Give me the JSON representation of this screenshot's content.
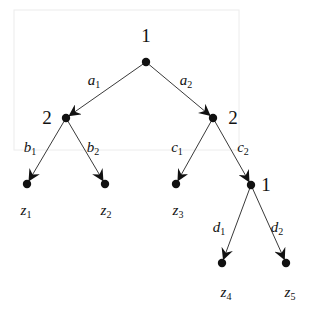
{
  "diagram": {
    "type": "extensive-form game tree",
    "nodes": [
      {
        "id": "root",
        "player": "1",
        "x": 146,
        "y": 62,
        "label_x": 146,
        "label_y": 42
      },
      {
        "id": "n2a",
        "player": "2",
        "x": 66,
        "y": 118,
        "label_x": 47,
        "label_y": 124
      },
      {
        "id": "n2b",
        "player": "2",
        "x": 213,
        "y": 118,
        "label_x": 233,
        "label_y": 124
      },
      {
        "id": "n1b",
        "player": "1",
        "x": 251,
        "y": 185,
        "label_x": 266,
        "label_y": 191
      }
    ],
    "leaves": [
      {
        "id": "z1",
        "base": "z",
        "sub": "1",
        "x": 27,
        "y": 184,
        "label_x": 26,
        "label_y": 215
      },
      {
        "id": "z2",
        "base": "z",
        "sub": "2",
        "x": 105,
        "y": 184,
        "label_x": 106,
        "label_y": 215
      },
      {
        "id": "z3",
        "base": "z",
        "sub": "3",
        "x": 176,
        "y": 184,
        "label_x": 178,
        "label_y": 215
      },
      {
        "id": "z4",
        "base": "z",
        "sub": "4",
        "x": 222,
        "y": 263,
        "label_x": 226,
        "label_y": 297
      },
      {
        "id": "z5",
        "base": "z",
        "sub": "5",
        "x": 286,
        "y": 263,
        "label_x": 290,
        "label_y": 297
      }
    ],
    "edges": [
      {
        "from": "root",
        "to": "n2a",
        "base": "a",
        "sub": "1",
        "label_x": 94,
        "label_y": 85
      },
      {
        "from": "root",
        "to": "n2b",
        "base": "a",
        "sub": "2",
        "label_x": 186,
        "label_y": 85
      },
      {
        "from": "n2a",
        "to": "z1",
        "base": "b",
        "sub": "1",
        "label_x": 30,
        "label_y": 152
      },
      {
        "from": "n2a",
        "to": "z2",
        "base": "b",
        "sub": "2",
        "label_x": 93,
        "label_y": 152
      },
      {
        "from": "n2b",
        "to": "z3",
        "base": "c",
        "sub": "1",
        "label_x": 177,
        "label_y": 152
      },
      {
        "from": "n2b",
        "to": "n1b",
        "base": "c",
        "sub": "2",
        "label_x": 243,
        "label_y": 152
      },
      {
        "from": "n1b",
        "to": "z4",
        "base": "d",
        "sub": "1",
        "label_x": 219,
        "label_y": 232
      },
      {
        "from": "n1b",
        "to": "z5",
        "base": "d",
        "sub": "2",
        "label_x": 277,
        "label_y": 232
      }
    ]
  }
}
